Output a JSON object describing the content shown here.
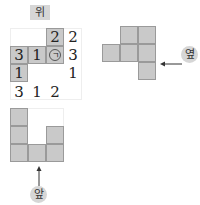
{
  "labels": {
    "top": "위",
    "side": "옆",
    "front": "앞"
  },
  "top_view": {
    "grid": [
      [
        null,
        null,
        "2"
      ],
      [
        "3",
        "1",
        "㉠"
      ],
      [
        "1",
        null,
        null
      ]
    ],
    "right_counts": [
      "2",
      "3",
      "1"
    ],
    "bottom_counts": [
      "3",
      "1",
      "2"
    ],
    "marker_label": "ㄱ"
  },
  "side_view": {
    "rows": [
      [
        0,
        1,
        1
      ],
      [
        1,
        1,
        1
      ],
      [
        0,
        0,
        1
      ]
    ]
  },
  "front_view": {
    "column_heights": [
      3,
      1,
      2
    ]
  },
  "colors": {
    "cell_fill": "#c9c9c9",
    "cell_border": "#9a9a9a",
    "badge_fill": "#d6d6d6"
  }
}
